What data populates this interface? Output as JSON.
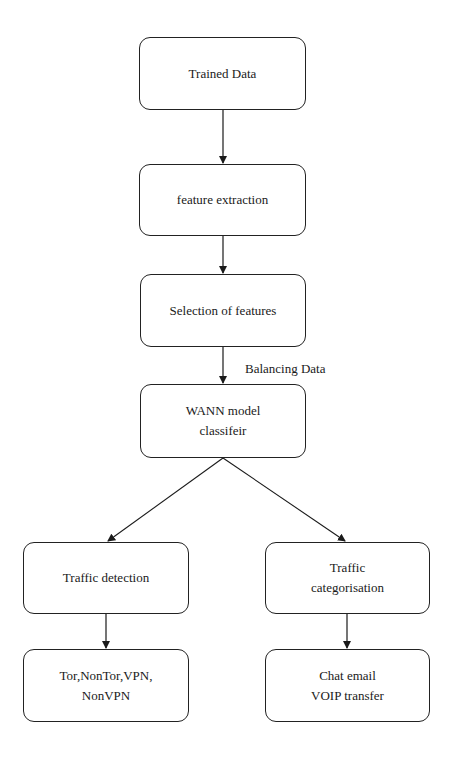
{
  "diagram": {
    "nodes": [
      {
        "id": "trained",
        "label": "Trained Data"
      },
      {
        "id": "feature",
        "label": "feature extraction"
      },
      {
        "id": "selection",
        "label": "Selection of features"
      },
      {
        "id": "wann",
        "label": "WANN model classifeir"
      },
      {
        "id": "detection",
        "label": "Traffic detection"
      },
      {
        "id": "categorisation",
        "label": "Traffic categorisation"
      },
      {
        "id": "tor",
        "label": "Tor,NonTor,VPN, NonVPN"
      },
      {
        "id": "chat",
        "label": "Chat email VOIP transfer"
      }
    ],
    "edges": [
      {
        "from": "trained",
        "to": "feature"
      },
      {
        "from": "feature",
        "to": "selection"
      },
      {
        "from": "selection",
        "to": "wann",
        "label": "Balancing Data"
      },
      {
        "from": "wann",
        "to": "detection"
      },
      {
        "from": "wann",
        "to": "categorisation"
      },
      {
        "from": "detection",
        "to": "tor"
      },
      {
        "from": "categorisation",
        "to": "chat"
      }
    ]
  }
}
